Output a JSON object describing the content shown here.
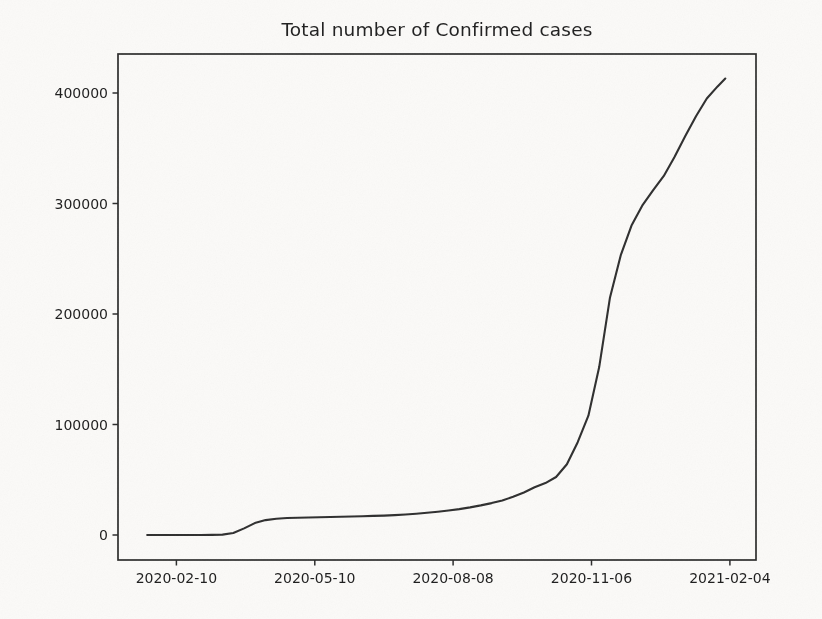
{
  "figure": {
    "title": "Total number of Confirmed cases"
  },
  "chart_data": {
    "type": "line",
    "title": "Total number of Confirmed cases",
    "series_name": "cumulative-confirmed-cases",
    "xlabel": "",
    "ylabel": "",
    "grid": false,
    "legend": false,
    "line_color": "#2e2e2e",
    "axis_color": "#2b2b2b",
    "text_color": "#1c1c1c",
    "background_color": "#fbfaf8",
    "xtick_labels": [
      "2020-02-10",
      "2020-05-10",
      "2020-08-08",
      "2020-11-06",
      "2021-02-04"
    ],
    "ytick_values": [
      0,
      100000,
      200000,
      300000,
      400000
    ],
    "ytick_labels": [
      "0",
      "100000",
      "200000",
      "300000",
      "400000"
    ],
    "xlim": [
      "2020-01-03",
      "2021-02-21"
    ],
    "ylim": [
      -22600,
      435300
    ],
    "x": [
      "2020-01-22",
      "2020-01-29",
      "2020-02-05",
      "2020-02-12",
      "2020-02-19",
      "2020-02-26",
      "2020-03-04",
      "2020-03-11",
      "2020-03-18",
      "2020-03-25",
      "2020-04-01",
      "2020-04-08",
      "2020-04-15",
      "2020-04-22",
      "2020-04-29",
      "2020-05-06",
      "2020-05-13",
      "2020-05-20",
      "2020-05-27",
      "2020-06-03",
      "2020-06-10",
      "2020-06-17",
      "2020-06-24",
      "2020-07-01",
      "2020-07-08",
      "2020-07-15",
      "2020-07-22",
      "2020-07-29",
      "2020-08-05",
      "2020-08-12",
      "2020-08-19",
      "2020-08-26",
      "2020-09-02",
      "2020-09-09",
      "2020-09-16",
      "2020-09-23",
      "2020-09-30",
      "2020-10-07",
      "2020-10-14",
      "2020-10-21",
      "2020-10-28",
      "2020-11-04",
      "2020-11-11",
      "2020-11-18",
      "2020-11-25",
      "2020-12-02",
      "2020-12-09",
      "2020-12-16",
      "2020-12-23",
      "2020-12-30",
      "2021-01-06",
      "2021-01-13",
      "2021-01-20",
      "2021-01-27",
      "2021-02-01"
    ],
    "values": [
      0,
      0,
      0,
      2,
      5,
      20,
      90,
      400,
      1800,
      6000,
      10800,
      13500,
      14800,
      15400,
      15700,
      15900,
      16100,
      16300,
      16600,
      16800,
      17000,
      17300,
      17600,
      18000,
      18600,
      19300,
      20100,
      21100,
      22200,
      23500,
      25000,
      26800,
      28900,
      31300,
      34600,
      38500,
      43200,
      47000,
      52500,
      64000,
      84000,
      108000,
      152000,
      215000,
      253000,
      280000,
      298000,
      312000,
      325000,
      342000,
      361000,
      379000,
      395000,
      406000,
      413000
    ]
  }
}
